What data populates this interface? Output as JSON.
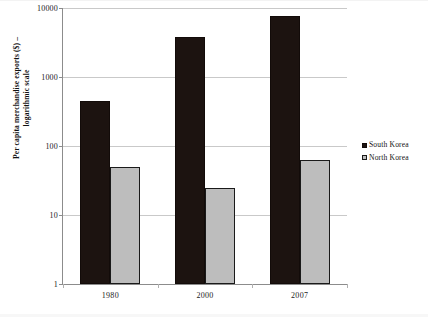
{
  "chart_data": {
    "type": "bar",
    "title": "",
    "subtitle": "",
    "xlabel": "",
    "ylabel": "Per capita merchandise exports ($) – logarithmic scale",
    "ylabel_line1": "Per capita merchandise exports ($) –",
    "ylabel_line2": "logarithmic scale",
    "scale": "log10",
    "ylim": [
      1,
      10000
    ],
    "ytick_labels": [
      "10000",
      "1000",
      "100",
      "10",
      "1"
    ],
    "ytick_values": [
      10000,
      1000,
      100,
      10,
      1
    ],
    "grid": true,
    "legend_position": "right",
    "categories": [
      "1980",
      "2000",
      "2007"
    ],
    "series": [
      {
        "name": "South Korea",
        "color": "#1c1310",
        "values": [
          454,
          3800,
          7600
        ]
      },
      {
        "name": "North Korea",
        "color": "#bdbdbd",
        "values": [
          49,
          25,
          63
        ]
      }
    ]
  },
  "legend": {
    "items": [
      {
        "label": "South Korea",
        "marker": "filled-square-black"
      },
      {
        "label": "North Korea",
        "marker": "filled-square-gray"
      }
    ]
  }
}
